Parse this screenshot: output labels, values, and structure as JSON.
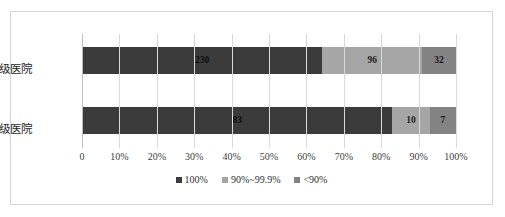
{
  "chart_data": {
    "type": "bar",
    "orientation": "horizontal",
    "stacked": true,
    "stack_mode": "percent",
    "title": "",
    "subtitle": "",
    "xlabel": "",
    "ylabel": "",
    "xlim": [
      0,
      100
    ],
    "grid": true,
    "legend_position": "bottom",
    "categories": [
      "三级医院",
      "二级医院"
    ],
    "xticks": [
      "0",
      "10%",
      "20%",
      "30%",
      "40%",
      "50%",
      "60%",
      "70%",
      "80%",
      "90%",
      "100%"
    ],
    "xtick_values": [
      0,
      10,
      20,
      30,
      40,
      50,
      60,
      70,
      80,
      90,
      100
    ],
    "series": [
      {
        "name": "100%",
        "color": "#3b3b3b",
        "values": [
          230,
          83
        ],
        "percents": [
          64.2,
          83.0
        ],
        "labels": [
          "230",
          "83"
        ]
      },
      {
        "name": "90%~99.9%",
        "color": "#a6a6a6",
        "values": [
          96,
          10
        ],
        "percents": [
          26.8,
          10.0
        ],
        "labels": [
          "96",
          "10"
        ]
      },
      {
        "name": "<90%",
        "color": "#838383",
        "values": [
          32,
          7
        ],
        "percents": [
          8.9,
          7.0
        ],
        "labels": [
          "32",
          "7"
        ]
      }
    ],
    "row_totals": [
      358,
      100
    ]
  },
  "colors": {
    "frame_border": "#d4d4d4",
    "gridline": "#d9d9d9",
    "axis": "#bfbfbf",
    "background": "#ffffff",
    "text": "#262626"
  }
}
